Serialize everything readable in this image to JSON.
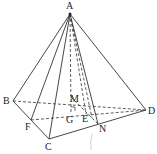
{
  "diagram": {
    "title": "",
    "points": {
      "A": {
        "label": "A",
        "x": 70,
        "y": 14
      },
      "B": {
        "label": "B",
        "x": 13,
        "y": 101
      },
      "C": {
        "label": "C",
        "x": 49,
        "y": 139
      },
      "D": {
        "label": "D",
        "x": 146,
        "y": 110
      },
      "F": {
        "label": "F",
        "x": 31,
        "y": 120
      },
      "G": {
        "label": "G",
        "x": 71,
        "y": 112
      },
      "M": {
        "label": "M",
        "x": 71,
        "y": 97
      },
      "E": {
        "label": "E",
        "x": 86,
        "y": 114
      },
      "N": {
        "label": "N",
        "x": 98,
        "y": 124
      }
    },
    "solid_edges": [
      [
        "A",
        "B"
      ],
      [
        "A",
        "C"
      ],
      [
        "A",
        "D"
      ],
      [
        "A",
        "F"
      ],
      [
        "B",
        "C"
      ],
      [
        "C",
        "D"
      ],
      [
        "A",
        "N"
      ]
    ],
    "dashed_edges": [
      [
        "B",
        "D"
      ],
      [
        "F",
        "D"
      ],
      [
        "A",
        "G"
      ],
      [
        "A",
        "E"
      ],
      [
        "M",
        "N"
      ]
    ],
    "right_angle_at": "G"
  }
}
